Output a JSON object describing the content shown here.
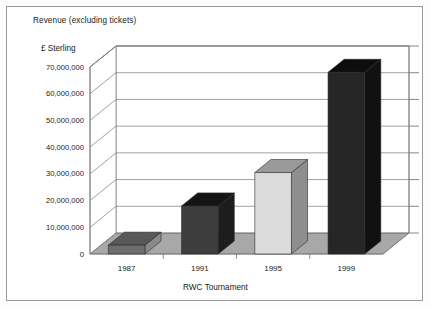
{
  "chart_data": {
    "type": "bar",
    "title": "Revenue (excluding tickets)",
    "xlabel": "RWC Tournament",
    "ylabel": "£ Sterling",
    "categories": [
      "1987",
      "1991",
      "1995",
      "1999"
    ],
    "values": [
      3300000,
      18000000,
      30500000,
      68000000
    ],
    "ylim": [
      0,
      70000000
    ],
    "ytick_values": [
      0,
      10000000,
      20000000,
      30000000,
      40000000,
      50000000,
      60000000,
      70000000
    ],
    "ytick_labels": [
      "0",
      "10,000,000",
      "20,000,000",
      "30,000,000",
      "40,000,000",
      "50,000,000",
      "60,000,000",
      "70,000,000"
    ],
    "grid": true,
    "legend": "none",
    "style": "3d-column",
    "bar_colors": [
      {
        "front": "#6e6e6e",
        "top": "#585858",
        "side": "#8a8a8a"
      },
      {
        "front": "#3d3d3d",
        "top": "#141414",
        "side": "#1d1d1d"
      },
      {
        "front": "#dcdcdc",
        "top": "#9a9a9a",
        "side": "#8e8e8e"
      },
      {
        "front": "#262626",
        "top": "#0d0d0d",
        "side": "#111111"
      }
    ],
    "floor_color": "#a8a8a8",
    "grid_color": "#7a7a7a",
    "frame_color": "#9a9a9a"
  }
}
